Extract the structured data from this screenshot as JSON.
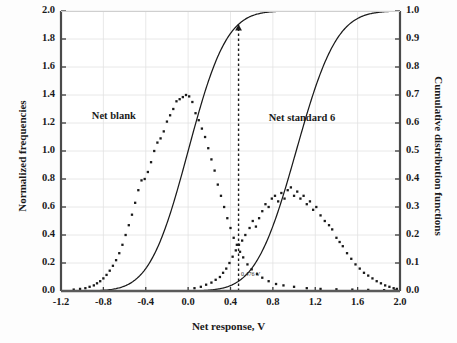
{
  "chart_data": {
    "type": "scatter",
    "title": "",
    "xlabel": "Net response, V",
    "ylabel": "Normalized frequencies",
    "ylabel_right": "Cumulative distribution functions",
    "xlim": [
      -1.2,
      2.0
    ],
    "ylim": [
      0.0,
      2.0
    ],
    "ylim_right": [
      0.0,
      1.0
    ],
    "grid": true,
    "legend_position": "inline-annotations",
    "xticks": [
      "-1.2",
      "-0.8",
      "-0.4",
      "0.0",
      "0.4",
      "0.8",
      "1.2",
      "1.6",
      "2.0"
    ],
    "xtick_values": [
      -1.2,
      -0.8,
      -0.4,
      0.0,
      0.4,
      0.8,
      1.2,
      1.6,
      2.0
    ],
    "yticks_left": [
      "0.0",
      "0.2",
      "0.4",
      "0.6",
      "0.8",
      "1.0",
      "1.2",
      "1.4",
      "1.6",
      "1.8",
      "2.0"
    ],
    "ytick_values_left": [
      0.0,
      0.2,
      0.4,
      0.6,
      0.8,
      1.0,
      1.2,
      1.4,
      1.6,
      1.8,
      2.0
    ],
    "yticks_right": [
      "0.0",
      "0.1",
      "0.2",
      "0.3",
      "0.4",
      "0.5",
      "0.6",
      "0.7",
      "0.8",
      "0.9",
      "1.0"
    ],
    "ytick_values_right": [
      0.0,
      0.1,
      0.2,
      0.3,
      0.4,
      0.5,
      0.6,
      0.7,
      0.8,
      0.9,
      1.0
    ],
    "annotations": [
      {
        "name": "net-blank-label",
        "text": "Net blank",
        "x": -0.55,
        "y": 1.24
      },
      {
        "name": "net-standard-6-label",
        "text": "Net standard 6",
        "x": 1.12,
        "y": 1.23
      },
      {
        "name": "critical-value-label",
        "text": "0.476 V",
        "x": 0.5,
        "y": 0.09
      }
    ],
    "critical_value": 0.476,
    "series": [
      {
        "name": "Net blank frequencies",
        "kind": "scatter",
        "axis": "left",
        "color": "#1a1a1a",
        "x": [
          -1.08,
          -1.02,
          -0.97,
          -0.93,
          -0.89,
          -0.86,
          -0.83,
          -0.8,
          -0.77,
          -0.74,
          -0.71,
          -0.68,
          -0.65,
          -0.62,
          -0.59,
          -0.56,
          -0.53,
          -0.5,
          -0.47,
          -0.44,
          -0.41,
          -0.38,
          -0.35,
          -0.32,
          -0.29,
          -0.26,
          -0.23,
          -0.2,
          -0.17,
          -0.14,
          -0.11,
          -0.08,
          -0.05,
          -0.02,
          0.01,
          0.04,
          0.07,
          0.1,
          0.13,
          0.16,
          0.19,
          0.22,
          0.25,
          0.28,
          0.31,
          0.34,
          0.37,
          0.4,
          0.43,
          0.46,
          0.49,
          0.52,
          0.56,
          0.6,
          0.65,
          0.7,
          0.76,
          0.83,
          0.9,
          1.0,
          1.12,
          1.25,
          1.4,
          1.55,
          1.7,
          1.85,
          1.95
        ],
        "y": [
          0.01,
          0.015,
          0.02,
          0.03,
          0.04,
          0.055,
          0.07,
          0.09,
          0.115,
          0.145,
          0.18,
          0.22,
          0.27,
          0.33,
          0.4,
          0.47,
          0.545,
          0.63,
          0.72,
          0.79,
          0.8,
          0.85,
          0.92,
          1.0,
          1.06,
          1.09,
          1.14,
          1.21,
          1.255,
          1.3,
          1.355,
          1.37,
          1.385,
          1.4,
          1.39,
          1.35,
          1.27,
          1.22,
          1.16,
          1.1,
          1.02,
          0.94,
          0.86,
          0.76,
          0.68,
          0.6,
          0.52,
          0.45,
          0.38,
          0.33,
          0.28,
          0.24,
          0.19,
          0.155,
          0.12,
          0.095,
          0.07,
          0.05,
          0.04,
          0.03,
          0.02,
          0.015,
          0.012,
          0.01,
          0.008,
          0.006,
          0.005
        ]
      },
      {
        "name": "Net standard 6 frequencies",
        "kind": "scatter",
        "axis": "left",
        "color": "#1a1a1a",
        "x": [
          0.06,
          0.12,
          0.17,
          0.22,
          0.26,
          0.3,
          0.33,
          0.36,
          0.39,
          0.42,
          0.45,
          0.48,
          0.51,
          0.54,
          0.58,
          0.61,
          0.64,
          0.67,
          0.7,
          0.73,
          0.76,
          0.79,
          0.82,
          0.85,
          0.88,
          0.91,
          0.94,
          0.97,
          1.0,
          1.03,
          1.06,
          1.09,
          1.12,
          1.15,
          1.18,
          1.21,
          1.25,
          1.29,
          1.33,
          1.36,
          1.4,
          1.43,
          1.46,
          1.5,
          1.54,
          1.58,
          1.62,
          1.66,
          1.7,
          1.74,
          1.78,
          1.82,
          1.86,
          1.9,
          1.94,
          1.97
        ],
        "y": [
          0.02,
          0.03,
          0.045,
          0.06,
          0.08,
          0.1,
          0.13,
          0.16,
          0.2,
          0.245,
          0.29,
          0.33,
          0.36,
          0.4,
          0.45,
          0.5,
          0.46,
          0.52,
          0.57,
          0.62,
          0.6,
          0.66,
          0.68,
          0.64,
          0.7,
          0.66,
          0.72,
          0.74,
          0.68,
          0.71,
          0.66,
          0.68,
          0.62,
          0.64,
          0.58,
          0.6,
          0.54,
          0.5,
          0.47,
          0.44,
          0.38,
          0.35,
          0.32,
          0.27,
          0.23,
          0.19,
          0.16,
          0.13,
          0.11,
          0.09,
          0.07,
          0.055,
          0.04,
          0.03,
          0.02,
          0.015
        ]
      },
      {
        "name": "Net blank cumulative distribution function",
        "kind": "line",
        "axis": "right",
        "color": "#1a1a1a",
        "mean": 0.0,
        "sigma": 0.285
      },
      {
        "name": "Net standard 6 cumulative distribution function",
        "kind": "line",
        "axis": "right",
        "color": "#1a1a1a",
        "mean": 1.02,
        "sigma": 0.3
      }
    ]
  }
}
